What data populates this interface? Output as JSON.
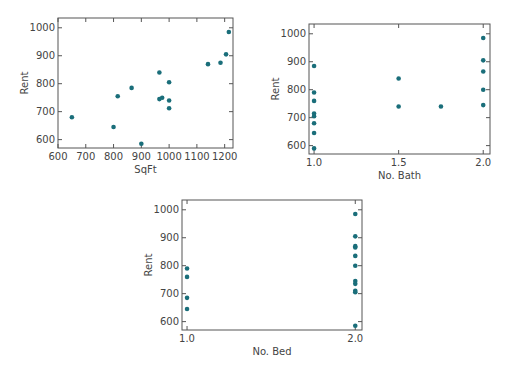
{
  "chart_data": [
    {
      "type": "scatter",
      "title": "",
      "xlabel": "SqFt",
      "ylabel": "Rent",
      "xlim": [
        600,
        1230
      ],
      "ylim": [
        570,
        1035
      ],
      "xticks": [
        600,
        700,
        800,
        900,
        1000,
        1100,
        1200
      ],
      "yticks": [
        600,
        700,
        800,
        900,
        1000
      ],
      "xtick_labels": [
        "600",
        "700",
        "800",
        "900",
        "1000",
        "1100",
        "1200"
      ],
      "ytick_labels": [
        "600",
        "700",
        "800",
        "900",
        "1000"
      ],
      "grid": false,
      "marker_color": "#1a6e7a",
      "x": [
        650,
        800,
        815,
        865,
        900,
        965,
        975,
        965,
        1000,
        1000,
        1000,
        1140,
        1185,
        1205,
        1215
      ],
      "y": [
        680,
        645,
        755,
        785,
        585,
        745,
        750,
        840,
        805,
        740,
        712,
        870,
        875,
        905,
        985
      ]
    },
    {
      "type": "scatter",
      "title": "",
      "xlabel": "No. Bath",
      "ylabel": "Rent",
      "xlim": [
        0.97,
        2.04
      ],
      "ylim": [
        570,
        1035
      ],
      "xticks": [
        1.0,
        1.5,
        2.0
      ],
      "yticks": [
        600,
        700,
        800,
        900,
        1000
      ],
      "xtick_labels": [
        "1.0",
        "1.5",
        "2.0"
      ],
      "ytick_labels": [
        "600",
        "700",
        "800",
        "900",
        "1000"
      ],
      "grid": false,
      "marker_color": "#1a6e7a",
      "x": [
        1.0,
        1.0,
        1.0,
        1.0,
        1.0,
        1.0,
        1.0,
        1.0,
        1.5,
        1.5,
        1.75,
        2.0,
        2.0,
        2.0,
        2.0,
        2.0
      ],
      "y": [
        590,
        645,
        680,
        705,
        715,
        760,
        790,
        885,
        840,
        740,
        740,
        985,
        905,
        865,
        800,
        745
      ]
    },
    {
      "type": "scatter",
      "title": "",
      "xlabel": "No. Bed",
      "ylabel": "Rent",
      "xlim": [
        0.97,
        2.04
      ],
      "ylim": [
        570,
        1035
      ],
      "xticks": [
        1.0,
        2.0
      ],
      "yticks": [
        600,
        700,
        800,
        900,
        1000
      ],
      "xtick_labels": [
        "1.0",
        "2.0"
      ],
      "ytick_labels": [
        "600",
        "700",
        "800",
        "900",
        "1000"
      ],
      "grid": false,
      "marker_color": "#1a6e7a",
      "x": [
        1.0,
        1.0,
        1.0,
        1.0,
        2.0,
        2.0,
        2.0,
        2.0,
        2.0,
        2.0,
        2.0,
        2.0,
        2.0,
        2.0,
        2.0
      ],
      "y": [
        790,
        760,
        685,
        645,
        985,
        905,
        870,
        865,
        835,
        800,
        745,
        735,
        710,
        705,
        585
      ]
    }
  ]
}
